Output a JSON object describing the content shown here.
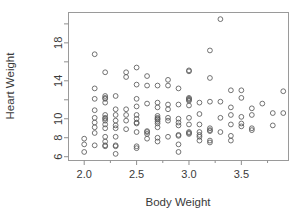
{
  "chart_data": {
    "type": "scatter",
    "title": "",
    "xlabel": "Body Weight",
    "ylabel": "Heart Weight",
    "xlim": [
      1.85,
      3.95
    ],
    "ylim": [
      5.6,
      21.2
    ],
    "grid": false,
    "legend": null,
    "marker": {
      "shape": "circle-open",
      "radius_px": 2.4,
      "stroke": "#5a5a5a"
    },
    "xticks": [
      2.0,
      2.5,
      3.0,
      3.5
    ],
    "xtick_labels": [
      "2.0",
      "2.5",
      "3.0",
      "3.5"
    ],
    "xticks_minor": [
      2.25,
      2.75,
      3.25,
      3.75
    ],
    "yticks": [
      6,
      8,
      10,
      14,
      18
    ],
    "ytick_labels": [
      "6",
      "8",
      "10",
      "14",
      "18"
    ],
    "yticks_minor": [
      12,
      16,
      20
    ],
    "x": [
      2.0,
      2.0,
      2.0,
      2.1,
      2.1,
      2.1,
      2.1,
      2.1,
      2.1,
      2.1,
      2.1,
      2.1,
      2.2,
      2.2,
      2.2,
      2.2,
      2.2,
      2.2,
      2.2,
      2.2,
      2.2,
      2.2,
      2.2,
      2.2,
      2.2,
      2.2,
      2.2,
      2.3,
      2.3,
      2.3,
      2.3,
      2.3,
      2.3,
      2.3,
      2.3,
      2.3,
      2.3,
      2.4,
      2.4,
      2.4,
      2.4,
      2.4,
      2.4,
      2.5,
      2.5,
      2.5,
      2.5,
      2.5,
      2.5,
      2.5,
      2.5,
      2.5,
      2.5,
      2.5,
      2.6,
      2.6,
      2.6,
      2.6,
      2.6,
      2.6,
      2.6,
      2.7,
      2.7,
      2.7,
      2.7,
      2.7,
      2.7,
      2.7,
      2.7,
      2.7,
      2.7,
      2.7,
      2.7,
      2.8,
      2.8,
      2.8,
      2.8,
      2.8,
      2.8,
      2.8,
      2.9,
      2.9,
      2.9,
      2.9,
      2.9,
      2.9,
      2.9,
      2.9,
      2.9,
      3.0,
      3.0,
      3.0,
      3.0,
      3.0,
      3.0,
      3.0,
      3.0,
      3.0,
      3.0,
      3.0,
      3.0,
      3.1,
      3.1,
      3.1,
      3.1,
      3.1,
      3.1,
      3.1,
      3.2,
      3.2,
      3.2,
      3.2,
      3.2,
      3.2,
      3.2,
      3.2,
      3.3,
      3.3,
      3.3,
      3.3,
      3.4,
      3.4,
      3.4,
      3.4,
      3.4,
      3.4,
      3.5,
      3.5,
      3.5,
      3.5,
      3.5,
      3.6,
      3.6,
      3.6,
      3.6,
      3.7,
      3.8,
      3.8,
      3.9,
      3.9
    ],
    "y": [
      6.5,
      7.3,
      7.9,
      7.2,
      8.5,
      9.1,
      9.6,
      10.1,
      10.9,
      12.1,
      13.2,
      16.8,
      7.1,
      7.2,
      7.6,
      8.1,
      9.0,
      9.4,
      9.8,
      10.0,
      10.1,
      10.4,
      11.7,
      12.1,
      12.2,
      12.4,
      14.9,
      6.3,
      7.1,
      7.2,
      8.1,
      9.0,
      9.3,
      9.8,
      10.4,
      11.0,
      12.4,
      8.9,
      9.8,
      10.4,
      11.0,
      14.4,
      14.9,
      6.9,
      7.1,
      8.6,
      9.5,
      9.6,
      10.0,
      10.4,
      11.3,
      12.1,
      13.6,
      15.4,
      7.9,
      8.4,
      8.6,
      8.7,
      11.6,
      13.5,
      14.5,
      7.6,
      8.0,
      9.1,
      9.5,
      9.7,
      9.9,
      10.0,
      10.1,
      10.3,
      11.2,
      11.7,
      13.5,
      8.1,
      9.8,
      10.1,
      11.0,
      11.5,
      13.5,
      14.1,
      6.5,
      7.3,
      8.2,
      8.3,
      9.3,
      9.6,
      10.0,
      11.5,
      13.2,
      8.4,
      8.5,
      8.6,
      9.4,
      10.1,
      11.4,
      11.9,
      12.0,
      12.1,
      12.2,
      15.0,
      15.1,
      7.7,
      8.1,
      8.3,
      8.6,
      9.4,
      10.5,
      11.7,
      7.5,
      7.7,
      8.7,
      8.8,
      9.0,
      11.8,
      14.3,
      17.2,
      8.6,
      10.1,
      11.8,
      20.5,
      7.7,
      8.2,
      9.4,
      10.4,
      11.2,
      13.0,
      9.2,
      9.5,
      10.2,
      12.2,
      13.0,
      8.8,
      9.0,
      10.4,
      11.1,
      11.6,
      9.3,
      10.6,
      10.6,
      12.9
    ],
    "n_points": 139
  }
}
